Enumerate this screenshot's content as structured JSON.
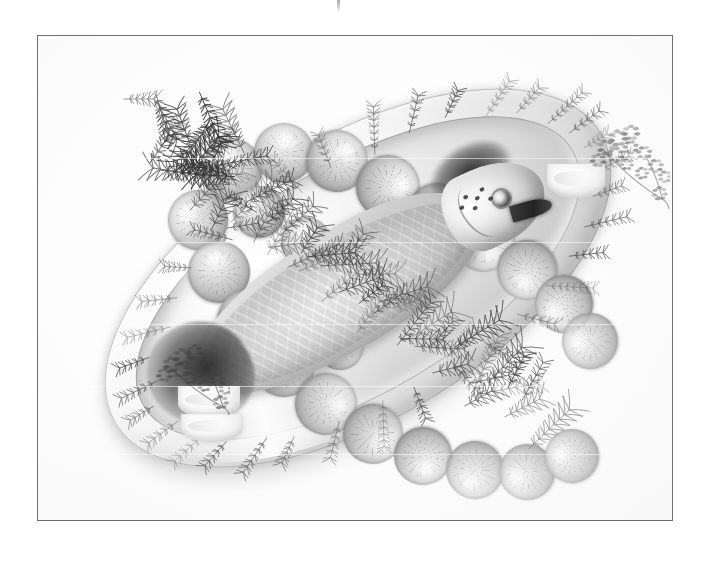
{
  "image": {
    "title": "Whole poached salmon on oval serving platter",
    "medium": "black and white food photograph",
    "orientation": "landscape",
    "background_color": "#ffffff",
    "frame": {
      "border_color": "#6e6e6e",
      "border_width_px": 1,
      "left_px": 37,
      "top_px": 35,
      "width_px": 636,
      "height_px": 486
    },
    "registration_mark": {
      "name": "crop-tick-mark",
      "left_px": 337,
      "top_px": 0,
      "width_px": 3,
      "height_px": 12,
      "color": "#9a9a9a"
    }
  },
  "subject": {
    "main": "whole poached salmon",
    "serving_vessel": "large white oval porcelain platter",
    "platter_rotation_deg": -31,
    "platter_color": "#e8e8e8",
    "fish_color": "#d8d8d8",
    "fish_head_position": "lower right",
    "fish_tail_position": "upper left",
    "herb_covering": "dill fronds",
    "herb_color": "#4a4a4a",
    "surround": "ring of lemon slices"
  },
  "elements": {
    "lemon_slices": [
      {
        "cx": 193,
        "cy": 133,
        "r": 31
      },
      {
        "cx": 246,
        "cy": 117,
        "r": 30
      },
      {
        "cx": 299,
        "cy": 125,
        "r": 31
      },
      {
        "cx": 350,
        "cy": 151,
        "r": 32
      },
      {
        "cx": 399,
        "cy": 178,
        "r": 31
      },
      {
        "cx": 446,
        "cy": 205,
        "r": 31
      },
      {
        "cx": 489,
        "cy": 234,
        "r": 30
      },
      {
        "cx": 526,
        "cy": 268,
        "r": 29
      },
      {
        "cx": 552,
        "cy": 305,
        "r": 28
      },
      {
        "cx": 160,
        "cy": 184,
        "r": 30
      },
      {
        "cx": 181,
        "cy": 236,
        "r": 31
      },
      {
        "cx": 210,
        "cy": 285,
        "r": 31
      },
      {
        "cx": 246,
        "cy": 330,
        "r": 31
      },
      {
        "cx": 288,
        "cy": 368,
        "r": 31
      },
      {
        "cx": 335,
        "cy": 398,
        "r": 30
      },
      {
        "cx": 385,
        "cy": 420,
        "r": 29
      },
      {
        "cx": 437,
        "cy": 434,
        "r": 29
      },
      {
        "cx": 489,
        "cy": 436,
        "r": 28
      },
      {
        "cx": 534,
        "cy": 420,
        "r": 27
      },
      {
        "cx": 221,
        "cy": 176,
        "r": 26
      },
      {
        "cx": 268,
        "cy": 206,
        "r": 25
      },
      {
        "cx": 316,
        "cy": 240,
        "r": 25
      },
      {
        "cx": 256,
        "cy": 268,
        "r": 24
      },
      {
        "cx": 302,
        "cy": 310,
        "r": 24
      }
    ],
    "garnish_groups": [
      {
        "name": "garnish-top-right",
        "sprig": {
          "label": "parsley-sprig",
          "left": 536,
          "top": 82,
          "width": 96,
          "height": 92
        },
        "wedges": [
          {
            "left": 509,
            "top": 128,
            "width": 58,
            "height": 34,
            "radius": "0 0 58px 58px / 0 0 32px 32px"
          }
        ]
      },
      {
        "name": "garnish-bottom-left",
        "sprig": {
          "label": "parsley-sprig",
          "left": 104,
          "top": 304,
          "width": 88,
          "height": 76
        },
        "wedges": [
          {
            "left": 140,
            "top": 350,
            "width": 62,
            "height": 32,
            "radius": "0 0 62px 62px / 0 0 30px 30px"
          },
          {
            "left": 143,
            "top": 378,
            "width": 62,
            "height": 28,
            "radius": "0 0 62px 62px / 0 0 28px 28px"
          }
        ]
      }
    ],
    "fish_spots": [
      {
        "left": 26,
        "top": 20
      },
      {
        "left": 36,
        "top": 26
      },
      {
        "left": 30,
        "top": 34
      },
      {
        "left": 44,
        "top": 20
      },
      {
        "left": 48,
        "top": 32
      },
      {
        "left": 18,
        "top": 28
      }
    ],
    "scan_seams": [
      122,
      206,
      288,
      350,
      418
    ]
  },
  "palette": {
    "paper_white": "#ffffff",
    "frame_line": "#6e6e6e",
    "platter_light": "#f6f6f6",
    "platter_mid": "#d2d2d2",
    "platter_dark": "#a9a9a9",
    "lemon_mid": "#bdbdbd",
    "herb_dark": "#3c3c3c",
    "fish_flesh": "#e7e7e7",
    "shadow": "#8a8a8a"
  }
}
